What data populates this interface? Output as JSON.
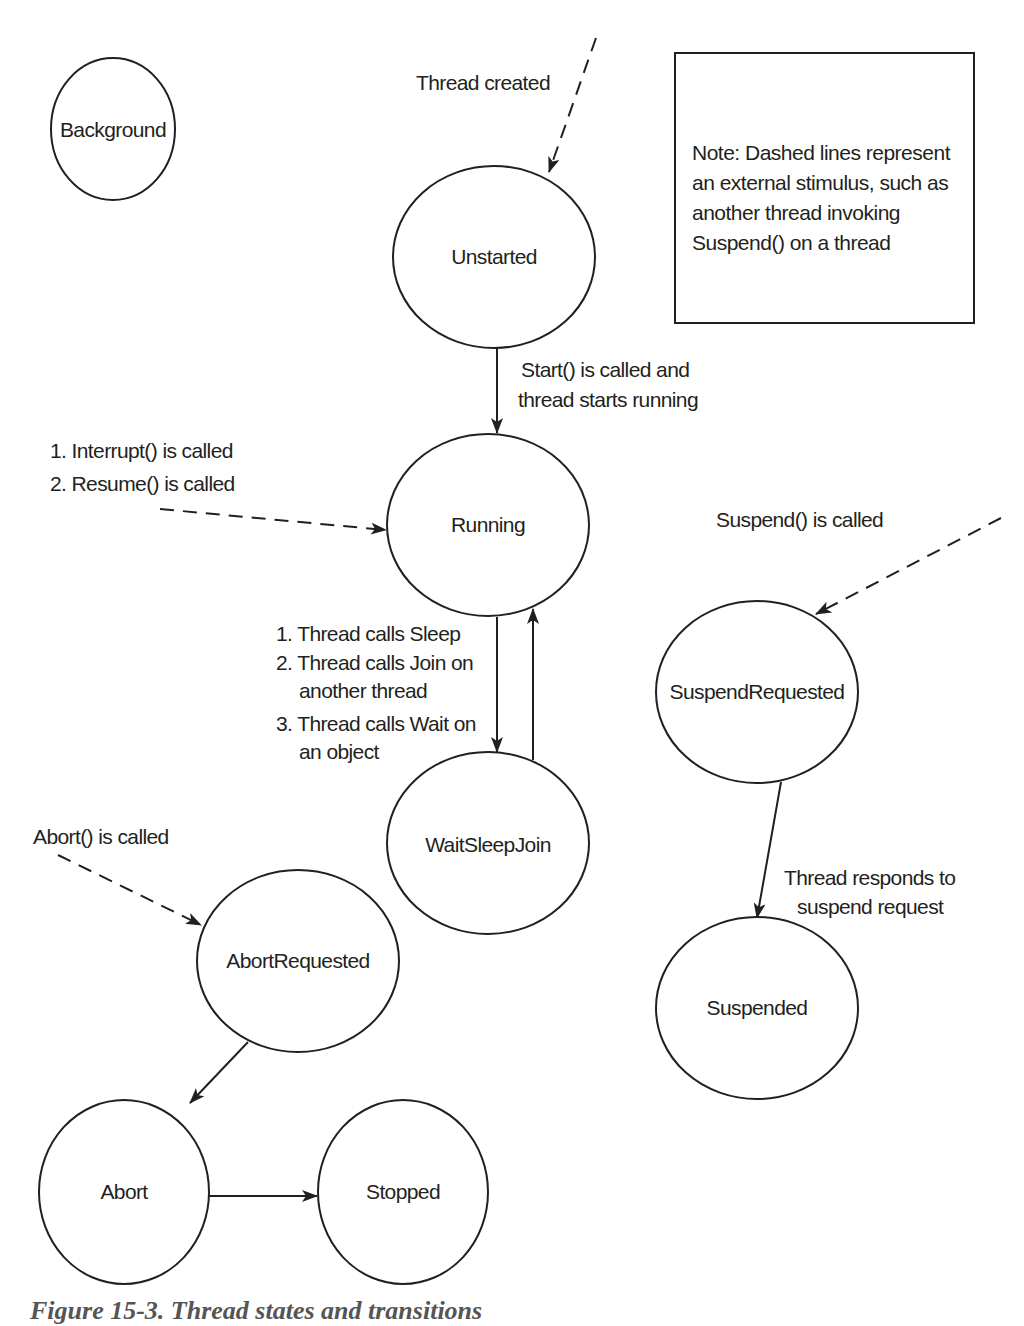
{
  "diagram": {
    "states": [
      {
        "id": "background",
        "label": "Background",
        "cx": 113,
        "cy": 129,
        "rx": 62,
        "ry": 71
      },
      {
        "id": "unstarted",
        "label": "Unstarted",
        "cx": 494,
        "cy": 257,
        "rx": 101,
        "ry": 91
      },
      {
        "id": "running",
        "label": "Running",
        "cx": 488,
        "cy": 525,
        "rx": 101,
        "ry": 91
      },
      {
        "id": "waitsleepjoin",
        "label": "WaitSleepJoin",
        "cx": 488,
        "cy": 843,
        "rx": 101,
        "ry": 91
      },
      {
        "id": "suspendrequested",
        "label": "SuspendRequested",
        "cx": 757,
        "cy": 692,
        "rx": 101,
        "ry": 91
      },
      {
        "id": "suspended",
        "label": "Suspended",
        "cx": 757,
        "cy": 1008,
        "rx": 101,
        "ry": 91
      },
      {
        "id": "abortrequested",
        "label": "AbortRequested",
        "cx": 298,
        "cy": 961,
        "rx": 101,
        "ry": 91
      },
      {
        "id": "abort",
        "label": "Abort",
        "cx": 124,
        "cy": 1192,
        "rx": 85,
        "ry": 92
      },
      {
        "id": "stopped",
        "label": "Stopped",
        "cx": 403,
        "cy": 1192,
        "rx": 85,
        "ry": 92
      }
    ],
    "transitions": [
      {
        "id": "thread-created",
        "from": "external",
        "to": "unstarted",
        "style": "dashed",
        "label_lines": [
          "Thread created"
        ]
      },
      {
        "id": "start-called",
        "from": "unstarted",
        "to": "running",
        "style": "solid",
        "label_lines": [
          "Start() is called and",
          "thread starts running"
        ]
      },
      {
        "id": "interrupt-resume",
        "from": "external",
        "to": "running",
        "style": "dashed",
        "label_lines": [
          "1. Interrupt() is called",
          "2. Resume() is called"
        ]
      },
      {
        "id": "thread-blocks",
        "from": "running",
        "to": "waitsleepjoin",
        "style": "solid",
        "label_lines": [
          "1. Thread calls Sleep",
          "2. Thread calls Join on",
          "another thread",
          "3. Thread calls Wait on",
          "an object"
        ]
      },
      {
        "id": "thread-unblocks",
        "from": "waitsleepjoin",
        "to": "running",
        "style": "solid",
        "label_lines": []
      },
      {
        "id": "suspend-called",
        "from": "external",
        "to": "suspendrequested",
        "style": "dashed",
        "label_lines": [
          "Suspend() is called"
        ]
      },
      {
        "id": "suspend-response",
        "from": "suspendrequested",
        "to": "suspended",
        "style": "solid",
        "label_lines": [
          "Thread responds to",
          "suspend request"
        ]
      },
      {
        "id": "abort-called",
        "from": "external",
        "to": "abortrequested",
        "style": "dashed",
        "label_lines": [
          "Abort() is called"
        ]
      },
      {
        "id": "abortrequested-to-abort",
        "from": "abortrequested",
        "to": "abort",
        "style": "solid",
        "label_lines": []
      },
      {
        "id": "abort-to-stopped",
        "from": "abort",
        "to": "stopped",
        "style": "solid",
        "label_lines": []
      }
    ],
    "note": {
      "lines": [
        "Note: Dashed lines represent",
        "an external stimulus, such as",
        "another thread invoking",
        "Suspend() on a thread"
      ]
    },
    "caption": "Figure 15-3. Thread states and transitions",
    "colors": {
      "stroke": "#231f20",
      "text": "#231f20",
      "background": "#ffffff",
      "caption": "#555555"
    }
  }
}
